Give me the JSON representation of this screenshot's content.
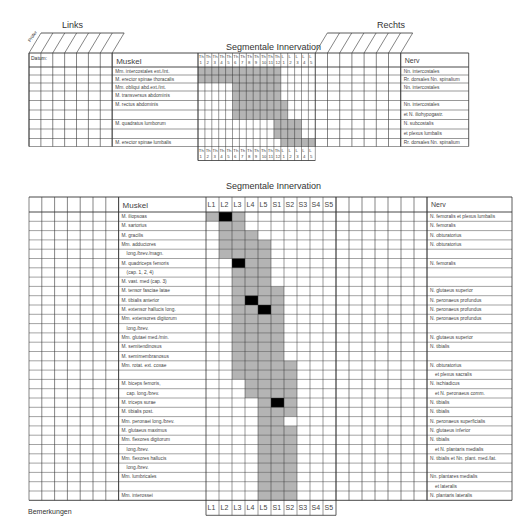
{
  "header": {
    "left_label": "Links",
    "right_label": "Rechts",
    "rotated_label": "Prüfer",
    "date_label": "Datum:"
  },
  "upper_table": {
    "title": "Segmentale Innervation",
    "muscle_header": "Muskel",
    "nerve_header": "Nerv",
    "segments": [
      "Th 1",
      "Th 2",
      "Th 3",
      "Th 4",
      "Th 5",
      "Th 6",
      "Th 7",
      "Th 8",
      "Th 9",
      "Th 10",
      "Th 11",
      "Th 12",
      "L 1",
      "L 2",
      "L 3",
      "L 4",
      "L 5"
    ],
    "rows": [
      {
        "muscle": "Mm. intercostales ext./int.",
        "nerve": "Nn. intercostales"
      },
      {
        "muscle": "M. erector spinae thoracalis",
        "nerve": "Rr. dorsales Nn. spinalium"
      },
      {
        "muscle": "Mm. obliqui abd.ext./int.",
        "nerve": "Nn. intercostales"
      },
      {
        "muscle": "M. transversus abdominis",
        "nerve": ""
      },
      {
        "muscle": "M. rectus abdominis",
        "nerve": "Nn. intercostales"
      },
      {
        "muscle": "",
        "nerve": "et N. iliohypogastr."
      },
      {
        "muscle": "M. quadratus lumborum",
        "nerve": "N. subcostalis"
      },
      {
        "muscle": "",
        "nerve": "et plexus lumbalis"
      },
      {
        "muscle": "M. erector spinae lumbalis",
        "nerve": "Rr. dorsales Nn. spinalium"
      }
    ]
  },
  "lower_table": {
    "title": "Segmentale Innervation",
    "muscle_header": "Muskel",
    "nerve_header": "Nerv",
    "segments": [
      "L1",
      "L2",
      "L3",
      "L4",
      "L5",
      "S1",
      "S2",
      "S3",
      "S4",
      "S5"
    ],
    "rows": [
      {
        "muscle": "M. iliopsoas",
        "nerve": "N. femoralis et plexus lumbalis"
      },
      {
        "muscle": "M. sartorius",
        "nerve": "N. femoralis"
      },
      {
        "muscle": "M. gracilis",
        "nerve": "N. obturatorius"
      },
      {
        "muscle": "Mm. adductores",
        "nerve": "N. obturatorius"
      },
      {
        "muscle": "long./brev./magn.",
        "nerve": ""
      },
      {
        "muscle": "M. quadriceps femoris",
        "nerve": "N. femoralis"
      },
      {
        "muscle": "(cap. 1, 2, 4)",
        "nerve": ""
      },
      {
        "muscle": "M. vast. med (cap. 3)",
        "nerve": ""
      },
      {
        "muscle": "M. tensor fasciae latae",
        "nerve": "N. glutaeus superior"
      },
      {
        "muscle": "M. tibialis anterior",
        "nerve": "N. peronaeus profundus"
      },
      {
        "muscle": "M. extensor hallucis long.",
        "nerve": "N. peronaeus profundus"
      },
      {
        "muscle": "Mm. extensores digitorum",
        "nerve": "N. peronaeus profundus"
      },
      {
        "muscle": "long./brev.",
        "nerve": ""
      },
      {
        "muscle": "Mm. glutaei med./min.",
        "nerve": "N. glutaeus superior"
      },
      {
        "muscle": "M. semitendinosus",
        "nerve": "N. tibialis"
      },
      {
        "muscle": "M. semimembranosus",
        "nerve": ""
      },
      {
        "muscle": "Mm. rotat. ext. coxae",
        "nerve": "N. obturatorius"
      },
      {
        "muscle": "",
        "nerve": "et plexus sacralis"
      },
      {
        "muscle": "M. biceps femoris,",
        "nerve": "N. ischiadicus"
      },
      {
        "muscle": "cap. long./brev.",
        "nerve": "et N. peronaeus comm."
      },
      {
        "muscle": "M. triceps surae",
        "nerve": "N. tibialis"
      },
      {
        "muscle": "M. tibialis post.",
        "nerve": "N. tibialis"
      },
      {
        "muscle": "Mm. peronaei long./brev.",
        "nerve": "N. peronaeus superficialis"
      },
      {
        "muscle": "M. glutaeus maximus",
        "nerve": "N. glutaeus inferior"
      },
      {
        "muscle": "Mm. flexores digitorum",
        "nerve": "N. tibialis"
      },
      {
        "muscle": "long./brev.",
        "nerve": "et N. plantaris medialis"
      },
      {
        "muscle": "Mm. flexores hallucis",
        "nerve": "N. tibialis et Nn. plant. med./lat."
      },
      {
        "muscle": "long./brev.",
        "nerve": ""
      },
      {
        "muscle": "Mm. lumbricales",
        "nerve": "Nn. plantares medialis"
      },
      {
        "muscle": "",
        "nerve": "et lateralis"
      },
      {
        "muscle": "Mm. interossei",
        "nerve": "N. plantaris lateralis"
      }
    ]
  },
  "footer": {
    "remarks_label": "Bemerkungen"
  },
  "colors": {
    "grid": "#333333",
    "shade": "#b4b4b4",
    "key": "#000000"
  }
}
